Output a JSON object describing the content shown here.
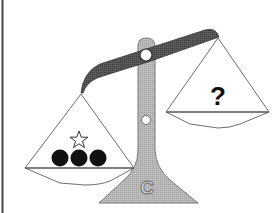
{
  "diagram": {
    "type": "balance-scale-puzzle",
    "left_pan": {
      "items": [
        {
          "shape": "star",
          "fill": "outline"
        },
        {
          "shape": "circle",
          "fill": "black"
        },
        {
          "shape": "circle",
          "fill": "black"
        },
        {
          "shape": "circle",
          "fill": "black"
        }
      ],
      "state": "lower"
    },
    "right_pan": {
      "label": "?",
      "state": "higher"
    },
    "base_label": "C",
    "colors": {
      "beam": "#555555",
      "pillar": "#b5b5b5",
      "outline": "#6e6e6e",
      "balls": "#111111",
      "border": "#444444"
    }
  }
}
